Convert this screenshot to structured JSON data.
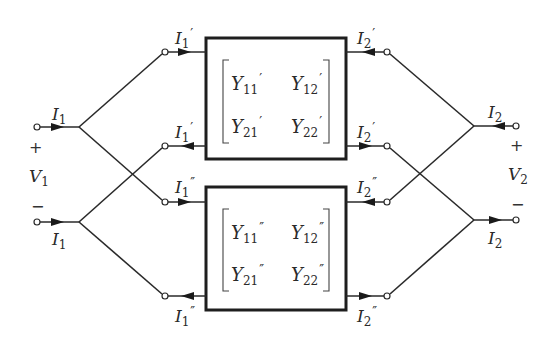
{
  "diagram": {
    "port1": {
      "current_top": {
        "base": "I",
        "sub": "1",
        "prime": ""
      },
      "current_bottom": {
        "base": "I",
        "sub": "1",
        "prime": ""
      },
      "plus": "+",
      "minus": "−",
      "voltage": {
        "base": "V",
        "sub": "1"
      }
    },
    "port2": {
      "current_top": {
        "base": "I",
        "sub": "2",
        "prime": ""
      },
      "current_bottom": {
        "base": "I",
        "sub": "2",
        "prime": ""
      },
      "plus": "+",
      "minus": "−",
      "voltage": {
        "base": "V",
        "sub": "2"
      }
    },
    "network_a": {
      "left_top_current": {
        "base": "I",
        "sub": "1",
        "prime": "′"
      },
      "left_bottom_current": {
        "base": "I",
        "sub": "1",
        "prime": "′"
      },
      "right_top_current": {
        "base": "I",
        "sub": "2",
        "prime": "′"
      },
      "right_bottom_current": {
        "base": "I",
        "sub": "2",
        "prime": "′"
      },
      "matrix": [
        [
          {
            "base": "Y",
            "sub": "11",
            "prime": "′"
          },
          {
            "base": "Y",
            "sub": "12",
            "prime": "′"
          }
        ],
        [
          {
            "base": "Y",
            "sub": "21",
            "prime": "′"
          },
          {
            "base": "Y",
            "sub": "22",
            "prime": "′"
          }
        ]
      ]
    },
    "network_b": {
      "left_top_current": {
        "base": "I",
        "sub": "1",
        "prime": "″"
      },
      "left_bottom_current": {
        "base": "I",
        "sub": "1",
        "prime": "″"
      },
      "right_top_current": {
        "base": "I",
        "sub": "2",
        "prime": "″"
      },
      "right_bottom_current": {
        "base": "I",
        "sub": "2",
        "prime": "″"
      },
      "matrix": [
        [
          {
            "base": "Y",
            "sub": "11",
            "prime": "″"
          },
          {
            "base": "Y",
            "sub": "12",
            "prime": "″"
          }
        ],
        [
          {
            "base": "Y",
            "sub": "21",
            "prime": "″"
          },
          {
            "base": "Y",
            "sub": "22",
            "prime": "″"
          }
        ]
      ]
    },
    "colors": {
      "line": "#2a2a2a",
      "box_border": "#1e1e1e",
      "background": "#ffffff"
    }
  }
}
